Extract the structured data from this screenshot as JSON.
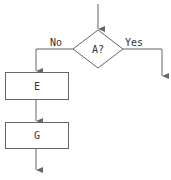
{
  "diagram": {
    "type": "flowchart",
    "decision": {
      "label": "A?",
      "yes_label": "Yes",
      "no_label": "No"
    },
    "boxes": [
      {
        "id": "E",
        "label": "E"
      },
      {
        "id": "G",
        "label": "G"
      }
    ],
    "edges": [
      {
        "from": "entry",
        "to": "A?"
      },
      {
        "from": "A?",
        "to": "E",
        "label": "No"
      },
      {
        "from": "A?",
        "to": "exit-right",
        "label": "Yes"
      },
      {
        "from": "E",
        "to": "G"
      },
      {
        "from": "G",
        "to": "exit-bottom"
      }
    ],
    "colors": {
      "line": "#666666",
      "text": "#333333",
      "background": "#ffffff"
    }
  }
}
